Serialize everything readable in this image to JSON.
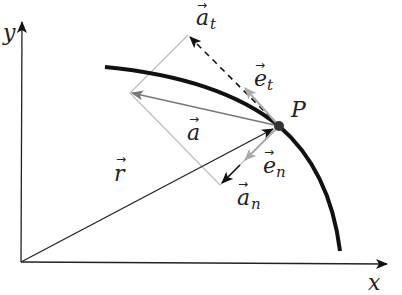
{
  "diagram": {
    "axes": {
      "x_label": "x",
      "y_label": "y"
    },
    "point": {
      "label": "P"
    },
    "vectors": [
      {
        "name": "position",
        "label": "r",
        "sub": "",
        "color": "#222222"
      },
      {
        "name": "acceleration",
        "label": "a",
        "sub": "",
        "color": "#777777"
      },
      {
        "name": "tangential-acceleration",
        "label": "a",
        "sub": "t",
        "color": "#111111",
        "style": "dashed"
      },
      {
        "name": "normal-acceleration",
        "label": "a",
        "sub": "n",
        "color": "#111111"
      },
      {
        "name": "tangent-unit-vector",
        "label": "e",
        "sub": "t",
        "color": "#aaaaaa"
      },
      {
        "name": "normal-unit-vector",
        "label": "e",
        "sub": "n",
        "color": "#aaaaaa"
      }
    ],
    "colors": {
      "curve": "#111111",
      "construction": "#bbbbbb",
      "point": "#333333"
    }
  }
}
